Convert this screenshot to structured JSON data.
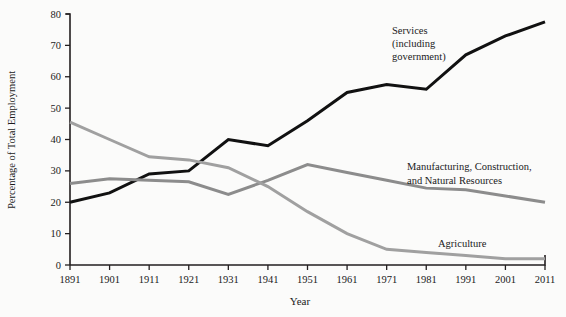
{
  "chart_data": {
    "type": "line",
    "title": "",
    "xlabel": "Year",
    "ylabel": "Percentage of Total Employment",
    "x": [
      1891,
      1901,
      1911,
      1921,
      1931,
      1941,
      1951,
      1961,
      1971,
      1981,
      1991,
      2001,
      2011
    ],
    "xtick_labels": [
      "1891",
      "1901",
      "1911",
      "1921",
      "1931",
      "1941",
      "1951",
      "1961",
      "1971",
      "1981",
      "1991",
      "2001",
      "2011"
    ],
    "ytick_labels": [
      "0",
      "10",
      "20",
      "30",
      "40",
      "50",
      "60",
      "70",
      "80"
    ],
    "ytick_values": [
      0,
      10,
      20,
      30,
      40,
      50,
      60,
      70,
      80
    ],
    "ylim": [
      0,
      80
    ],
    "xlim": [
      1891,
      2011
    ],
    "grid": false,
    "legend_position": "inline-annotations",
    "series": [
      {
        "name": "Services (including government)",
        "label_lines": [
          "Services",
          "(including",
          "government)"
        ],
        "color": "#111111",
        "stroke_width": 3.0,
        "values": [
          20,
          23,
          29,
          30,
          40,
          38,
          46,
          55,
          57.5,
          56,
          67,
          73,
          77.5
        ]
      },
      {
        "name": "Manufacturing, Construction, and Natural Resources",
        "label_lines": [
          "Manufacturing, Construction,",
          "and Natural Resources"
        ],
        "color": "#8c8c8c",
        "stroke_width": 3.0,
        "values": [
          26,
          27.5,
          27,
          26.5,
          22.5,
          27,
          32,
          29.5,
          27,
          24.5,
          24,
          22,
          20
        ]
      },
      {
        "name": "Agriculture",
        "label_lines": [
          "Agriculture"
        ],
        "color": "#a0a0a0",
        "stroke_width": 3.0,
        "values": [
          45.5,
          40,
          34.5,
          33.5,
          31,
          25,
          17,
          10,
          5,
          4,
          3,
          2,
          2
        ]
      }
    ],
    "annotations": [
      {
        "text": "Services",
        "x_px": 392,
        "y_px": 34
      },
      {
        "text": "(including",
        "x_px": 392,
        "y_px": 47
      },
      {
        "text": "government)",
        "x_px": 392,
        "y_px": 60
      },
      {
        "text": "Manufacturing, Construction,",
        "x_px": 407,
        "y_px": 170
      },
      {
        "text": "and Natural Resources",
        "x_px": 407,
        "y_px": 184
      },
      {
        "text": "Agriculture",
        "x_px": 438,
        "y_px": 247
      }
    ],
    "colors": {
      "background": "#fbfbfa",
      "axis": "#231f20",
      "services": "#111111",
      "manufacturing": "#8c8c8c",
      "agriculture": "#a0a0a0"
    }
  }
}
